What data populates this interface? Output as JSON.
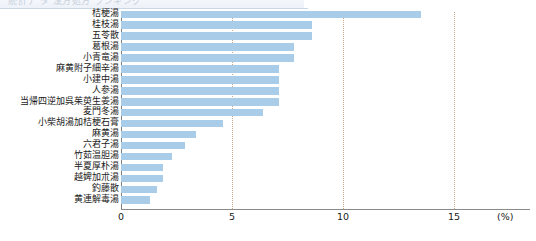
{
  "header": {
    "cut_off_text": "統計デ   タ  漢方処方  ランキング"
  },
  "chart_data": {
    "type": "bar",
    "orientation": "horizontal",
    "title": "",
    "subtitle": "",
    "xlabel": "(%)",
    "ylabel": "",
    "xlim": [
      0,
      16.5
    ],
    "xticks": [
      0,
      5,
      10,
      15
    ],
    "xtick_labels": [
      "0",
      "5",
      "10",
      "15"
    ],
    "grid": "vertical-dotted",
    "legend": "none",
    "bar_color": "#a9cce9",
    "categories": [
      "桔梗湯",
      "桂枝湯",
      "五苓散",
      "葛根湯",
      "小青竜湯",
      "麻黄附子細辛湯",
      "小建中湯",
      "人参湯",
      "当帰四逆加呉茱萸生姜湯",
      "麦門冬湯",
      "小柴胡湯加桔梗石膏",
      "麻黄湯",
      "六君子湯",
      "竹茹温胆湯",
      "半夏厚朴湯",
      "越婢加朮湯",
      "釣藤散",
      "黄連解毒湯"
    ],
    "values": [
      13.5,
      8.6,
      8.6,
      7.8,
      7.8,
      7.1,
      7.1,
      7.1,
      7.1,
      6.4,
      4.6,
      3.4,
      2.9,
      2.3,
      1.9,
      1.9,
      1.6,
      1.3
    ]
  }
}
